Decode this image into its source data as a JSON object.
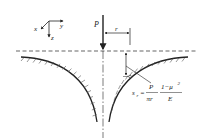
{
  "diagram": {
    "type": "engineering-schematic",
    "colors": {
      "ink": "#222222",
      "background": "#ffffff",
      "hatch": "#555555"
    },
    "axes": {
      "x_label": "x",
      "y_label": "y",
      "z_label": "z"
    },
    "load": {
      "label": "P"
    },
    "dimension": {
      "label": "r"
    },
    "formula": {
      "lhs": "s",
      "lhs_sub": "r",
      "equals": "=",
      "frac1_num": "P",
      "frac1_den": "πr",
      "frac2_num": "1−μ",
      "frac2_num_sup": "2",
      "frac2_den": "E"
    }
  }
}
